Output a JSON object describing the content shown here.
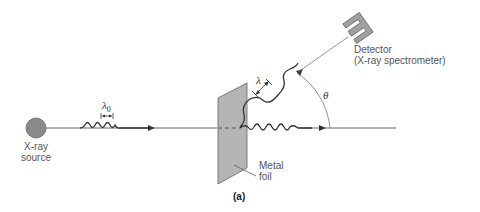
{
  "diagram": {
    "caption": "(a)",
    "source": {
      "line1": "X-ray",
      "line2": "source"
    },
    "foil": {
      "line1": "Metal",
      "line2": "foil"
    },
    "detector": {
      "line1": "Detector",
      "line2": "(X-ray spectrometer)"
    },
    "symbols": {
      "incident_wavelength": "λ",
      "incident_subscript": "0",
      "scattered_wavelength": "λ",
      "angle": "θ"
    },
    "colors": {
      "line": "#444444",
      "source_fill": "#8a8a8a",
      "foil_fill": "#b5b5b5",
      "detector_fill": "#a0a0a0",
      "label": "#555555"
    }
  }
}
